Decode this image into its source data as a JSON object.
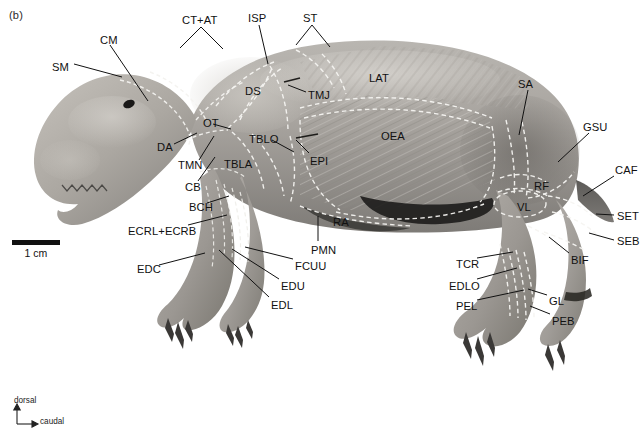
{
  "figure": {
    "panel_letter": "(b)",
    "scale_bar_label": "1 cm",
    "orientation": {
      "vertical": "dorsal",
      "horizontal": "caudal"
    },
    "background_color": "#ffffff",
    "label_color": "#111111",
    "outline_color": "#f2f2f2"
  },
  "labels": [
    {
      "id": "SM",
      "text": "SM",
      "x": 52,
      "y": 62
    },
    {
      "id": "CM",
      "text": "CM",
      "x": 100,
      "y": 35
    },
    {
      "id": "CT+AT",
      "text": "CT+AT",
      "x": 182,
      "y": 15
    },
    {
      "id": "ISP",
      "text": "ISP",
      "x": 248,
      "y": 13
    },
    {
      "id": "ST",
      "text": "ST",
      "x": 303,
      "y": 13
    },
    {
      "id": "LAT",
      "text": "LAT",
      "x": 369,
      "y": 73
    },
    {
      "id": "SA",
      "text": "SA",
      "x": 518,
      "y": 79
    },
    {
      "id": "GSU",
      "text": "GSU",
      "x": 583,
      "y": 122
    },
    {
      "id": "CAF",
      "text": "CAF",
      "x": 615,
      "y": 165
    },
    {
      "id": "SET",
      "text": "SET",
      "x": 617,
      "y": 211
    },
    {
      "id": "SEB",
      "text": "SEB",
      "x": 617,
      "y": 236
    },
    {
      "id": "BIF",
      "text": "BIF",
      "x": 571,
      "y": 255
    },
    {
      "id": "DS",
      "text": "DS",
      "x": 245,
      "y": 86
    },
    {
      "id": "TMJ",
      "text": "TMJ",
      "x": 308,
      "y": 90
    },
    {
      "id": "OEA",
      "text": "OEA",
      "x": 381,
      "y": 131
    },
    {
      "id": "OT",
      "text": "OT",
      "x": 203,
      "y": 118
    },
    {
      "id": "DA",
      "text": "DA",
      "x": 157,
      "y": 142
    },
    {
      "id": "TBLO",
      "text": "TBLO",
      "x": 249,
      "y": 134
    },
    {
      "id": "EPI",
      "text": "EPI",
      "x": 310,
      "y": 156
    },
    {
      "id": "TMN",
      "text": "TMN",
      "x": 178,
      "y": 160
    },
    {
      "id": "TBLA",
      "text": "TBLA",
      "x": 224,
      "y": 159
    },
    {
      "id": "CB",
      "text": "CB",
      "x": 185,
      "y": 182
    },
    {
      "id": "BCH",
      "text": "BCH",
      "x": 189,
      "y": 202
    },
    {
      "id": "ECRL+ECRB",
      "text": "ECRL+ECRB",
      "x": 128,
      "y": 226
    },
    {
      "id": "RA",
      "text": "RA",
      "x": 333,
      "y": 217
    },
    {
      "id": "PMN",
      "text": "PMN",
      "x": 311,
      "y": 245
    },
    {
      "id": "EDC",
      "text": "EDC",
      "x": 137,
      "y": 264
    },
    {
      "id": "FCUU",
      "text": "FCUU",
      "x": 295,
      "y": 261
    },
    {
      "id": "EDU",
      "text": "EDU",
      "x": 281,
      "y": 281
    },
    {
      "id": "EDL",
      "text": "EDL",
      "x": 271,
      "y": 300
    },
    {
      "id": "RF",
      "text": "RF",
      "x": 534,
      "y": 181
    },
    {
      "id": "VL",
      "text": "VL",
      "x": 517,
      "y": 202
    },
    {
      "id": "TCR",
      "text": "TCR",
      "x": 456,
      "y": 259
    },
    {
      "id": "EDLO",
      "text": "EDLO",
      "x": 449,
      "y": 281
    },
    {
      "id": "PEL",
      "text": "PEL",
      "x": 456,
      "y": 301
    },
    {
      "id": "GL",
      "text": "GL",
      "x": 549,
      "y": 296
    },
    {
      "id": "PEB",
      "text": "PEB",
      "x": 552,
      "y": 316
    }
  ],
  "leaders": [
    {
      "for": "SM",
      "d": "M 74 64  L 122 77"
    },
    {
      "for": "CM",
      "d": "M 110 45  L 148 101"
    },
    {
      "for": "CT+AT",
      "d": "M 201 27  L 180 48  M 201 27 L 223 49"
    },
    {
      "for": "ISP",
      "d": "M 259 25  L 268 64"
    },
    {
      "for": "ST",
      "d": "M 312 25  L 296 45  M 312 25 L 330 47"
    },
    {
      "for": "SA",
      "d": "M 528 90  L 519 135"
    },
    {
      "for": "GSU",
      "d": "M 589 133  L 558 162"
    },
    {
      "for": "CAF",
      "d": "M 614 176  L 583 196"
    },
    {
      "for": "SET",
      "d": "M 614 215  L 596 214"
    },
    {
      "for": "SEB",
      "d": "M 614 240  L 589 233"
    },
    {
      "for": "BIF",
      "d": "M 569 253  L 549 237"
    },
    {
      "for": "TMJ",
      "d": "M 306 92  L 288 85"
    },
    {
      "for": "OT",
      "d": "M 213 124  L 231 129"
    },
    {
      "for": "DA",
      "d": "M 174 144  L 197 133"
    },
    {
      "for": "TBLO",
      "d": "M 272 140  L 294 152"
    },
    {
      "for": "EPI",
      "d": "M 309 153  L 296 140"
    },
    {
      "for": "TMN",
      "d": "M 199 160  L 214 136"
    },
    {
      "for": "CB",
      "d": "M 198 181  L 215 157"
    },
    {
      "for": "BCH",
      "d": "M 207 203  L 229 196"
    },
    {
      "for": "ECRL+ECRB",
      "d": "M 188 225  L 227 215"
    },
    {
      "for": "PMN",
      "d": "M 318 241  L 318 216"
    },
    {
      "for": "EDC",
      "d": "M 159 265  L 205 253"
    },
    {
      "for": "FCUU",
      "d": "M 293 259  L 245 247"
    },
    {
      "for": "EDU",
      "d": "M 279 279  L 232 249"
    },
    {
      "for": "EDL",
      "d": "M 269 297  L 219 250"
    },
    {
      "for": "TCR",
      "d": "M 477 258  L 513 252"
    },
    {
      "for": "EDLO",
      "d": "M 477 279  L 517 268"
    },
    {
      "for": "PEL",
      "d": "M 477 300  L 524 290"
    },
    {
      "for": "GL",
      "d": "M 547 295  L 528 289"
    },
    {
      "for": "PEB",
      "d": "M 550 314  L 530 306"
    }
  ]
}
